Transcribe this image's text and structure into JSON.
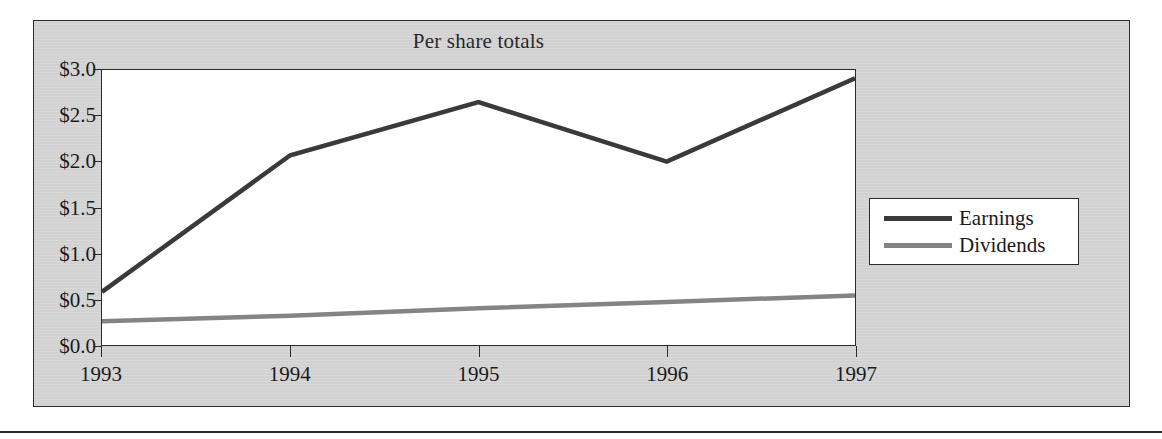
{
  "chart_data": {
    "type": "line",
    "title": "Per share totals",
    "xlabel": "",
    "ylabel": "",
    "x": [
      "1993",
      "1994",
      "1995",
      "1996",
      "1997"
    ],
    "categories": [
      "1993",
      "1994",
      "1995",
      "1996",
      "1997"
    ],
    "series": [
      {
        "name": "Earnings",
        "values": [
          0.58,
          2.07,
          2.65,
          2.0,
          2.91
        ],
        "color": "#3a3a3a"
      },
      {
        "name": "Dividends",
        "values": [
          0.26,
          0.32,
          0.4,
          0.47,
          0.54
        ],
        "color": "#848484"
      }
    ],
    "ylim": [
      0.0,
      3.0
    ],
    "ytick_labels": [
      "$3.0",
      "$2.5",
      "$2.0",
      "$1.5",
      "$1.0",
      "$0.5",
      "$0.0"
    ],
    "ytick_values": [
      3.0,
      2.5,
      2.0,
      1.5,
      1.0,
      0.5,
      0.0
    ],
    "xtick_labels": [
      "1993",
      "1994",
      "1995",
      "1996",
      "1997"
    ],
    "grid": false,
    "legend_position": "right-middle",
    "legend_entries": [
      "Earnings",
      "Dividends"
    ]
  },
  "legend": {
    "entries": [
      {
        "label": "Earnings"
      },
      {
        "label": "Dividends"
      }
    ]
  },
  "colors": {
    "panel_background": "#d6d6d6",
    "plot_background": "#ffffff",
    "axis": "#2b2b2b",
    "earnings_line": "#3a3a3a",
    "dividends_line": "#848484",
    "text": "#1a1a1a"
  }
}
